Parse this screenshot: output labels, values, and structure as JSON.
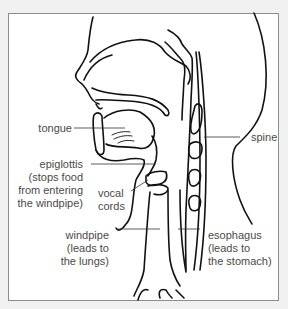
{
  "diagram": {
    "labels": {
      "tongue": [
        "tongue"
      ],
      "spine": [
        "spine"
      ],
      "epiglottis": [
        "epiglottis",
        "(stops food",
        "from entering",
        "the windpipe)"
      ],
      "vocal_cords": [
        "vocal",
        "cords"
      ],
      "windpipe": [
        "windpipe",
        "(leads to",
        "the lungs)"
      ],
      "esophagus": [
        "esophagus",
        "(leads to",
        "the stomach)"
      ]
    },
    "colors": {
      "background": "#f1f1f1",
      "frame_fill": "#ffffff",
      "frame_border": "#8c8c8c",
      "line": "#111111",
      "text": "#4a4a4a"
    }
  }
}
